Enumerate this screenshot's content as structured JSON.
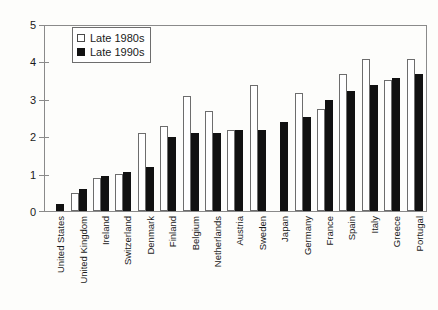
{
  "chart_data": {
    "type": "bar",
    "title": "",
    "subtitle": "",
    "xlabel": "",
    "ylabel": "",
    "ylim": [
      0,
      5
    ],
    "yticks": [
      0,
      1,
      2,
      3,
      4,
      5
    ],
    "ytick_labels": [
      "0",
      "1",
      "2",
      "3",
      "4",
      "5"
    ],
    "grid": false,
    "legend_position": "top-left",
    "categories": [
      "United States",
      "United Kingdom",
      "Ireland",
      "Switzerland",
      "Denmark",
      "Finland",
      "Belgium",
      "Netherlands",
      "Austria",
      "Sweden",
      "Japan",
      "Germany",
      "France",
      "Spain",
      "Italy",
      "Greece",
      "Portugal"
    ],
    "series": [
      {
        "name": "Late 1980s",
        "color": "#ffffff",
        "values": [
          null,
          0.5,
          0.9,
          1.0,
          2.1,
          2.3,
          3.1,
          2.7,
          2.2,
          3.4,
          null,
          3.2,
          2.75,
          3.7,
          4.1,
          3.55,
          4.1
        ]
      },
      {
        "name": "Late 1990s",
        "color": "#111111",
        "values": [
          0.2,
          0.6,
          0.95,
          1.05,
          1.2,
          2.0,
          2.1,
          2.1,
          2.2,
          2.2,
          2.4,
          2.55,
          3.0,
          3.25,
          3.4,
          3.6,
          3.7
        ]
      }
    ]
  },
  "legend": {
    "entries": [
      {
        "label": "Late 1980s",
        "swatch": "open-square-icon"
      },
      {
        "label": "Late 1990s",
        "swatch": "filled-square-icon"
      }
    ]
  }
}
